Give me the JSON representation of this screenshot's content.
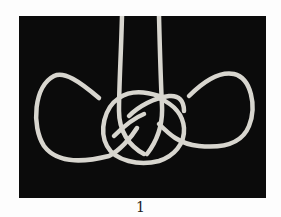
{
  "figure": {
    "caption": "1",
    "colors": {
      "background": "#0b0b0b",
      "rope": "#d8d6cf",
      "page": "#fdfdfd"
    }
  }
}
